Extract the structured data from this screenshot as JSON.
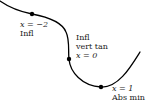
{
  "diagram": {
    "curve": {
      "color": "#000000",
      "stroke_width": 1.3,
      "path": "M 0 1 C 10 8, 22 12, 32 14 C 48 17, 62 22, 66 32 C 70 40, 68 52, 69 59 C 70 72, 82 86, 101 87 C 118 88, 130 68, 140 52"
    },
    "points": [
      {
        "name": "inflection-point-x-neg2",
        "x": 32,
        "y": 14
      },
      {
        "name": "inflection-vert-tan-point-x-0",
        "x": 69,
        "y": 59
      },
      {
        "name": "abs-min-point-x-1",
        "x": 101,
        "y": 87
      }
    ],
    "annotations": [
      {
        "name": "x-neg2-annotation",
        "left": 20,
        "top": 20,
        "lines": {
          "eq": "x = −2",
          "desc1": "Infl"
        }
      },
      {
        "name": "x-0-annotation",
        "left": 76,
        "top": 32,
        "lines": {
          "desc1": "Infl",
          "desc2": "vert tan",
          "eq": "x = 0"
        }
      },
      {
        "name": "x-1-annotation",
        "left": 112,
        "top": 84,
        "lines": {
          "eq": "x = 1",
          "desc1": "Abs min"
        }
      }
    ]
  }
}
